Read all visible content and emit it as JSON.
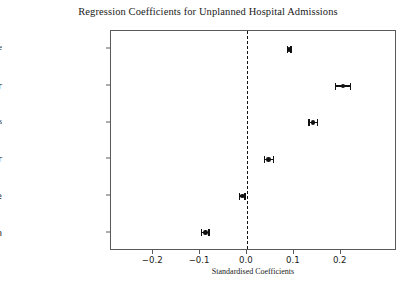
{
  "chart_data": {
    "type": "scatter",
    "title": "Regression Coefficients for Unplanned Hospital Admissions",
    "xlabel": "Standardised Coefficients",
    "ylabel": "",
    "orientation": "horizontal",
    "grid": false,
    "legend": null,
    "xlim": [
      -0.29,
      0.32
    ],
    "xticks": [
      -0.2,
      -0.1,
      0.0,
      0.1,
      0.2
    ],
    "xticklabels": [
      "−0.2",
      "−0.1",
      "0.0",
      "0.1",
      "0.2"
    ],
    "reference_line": {
      "x": 0.0,
      "style": "dashed",
      "color": "#111111"
    },
    "categories": [
      "Age",
      "Smoker",
      "No Smoking Status",
      "Ex Smoker",
      "Female",
      "GP Management Plan"
    ],
    "values": [
      0.09,
      0.205,
      0.141,
      0.046,
      -0.01,
      -0.089
    ],
    "ci_low": [
      0.086,
      0.189,
      0.132,
      0.037,
      -0.016,
      -0.097
    ],
    "ci_high": [
      0.094,
      0.221,
      0.15,
      0.057,
      -0.004,
      -0.081
    ],
    "points": [
      {
        "label": "Age",
        "value": 0.09,
        "ci_low": 0.086,
        "ci_high": 0.094,
        "label_style": "serif-small"
      },
      {
        "label": "Smoker",
        "value": 0.205,
        "ci_low": 0.189,
        "ci_high": 0.221,
        "label_style": "sans-big"
      },
      {
        "label": "No Smoking Status",
        "value": 0.141,
        "ci_low": 0.132,
        "ci_high": 0.15,
        "label_style": "serif-small"
      },
      {
        "label": "Ex Smoker",
        "value": 0.046,
        "ci_low": 0.037,
        "ci_high": 0.057,
        "label_style": "sans-big"
      },
      {
        "label": "Female",
        "value": -0.01,
        "ci_low": -0.016,
        "ci_high": -0.004,
        "label_style": "sans-big"
      },
      {
        "label": "GP Management Plan",
        "value": -0.089,
        "ci_low": -0.097,
        "ci_high": -0.081,
        "label_style": "sans-big"
      }
    ]
  },
  "colors": {
    "marker": "#111111",
    "error_bar": "#111111",
    "axis": "#5a5a5a",
    "text": "#1a1a1a",
    "background": "#ffffff"
  }
}
